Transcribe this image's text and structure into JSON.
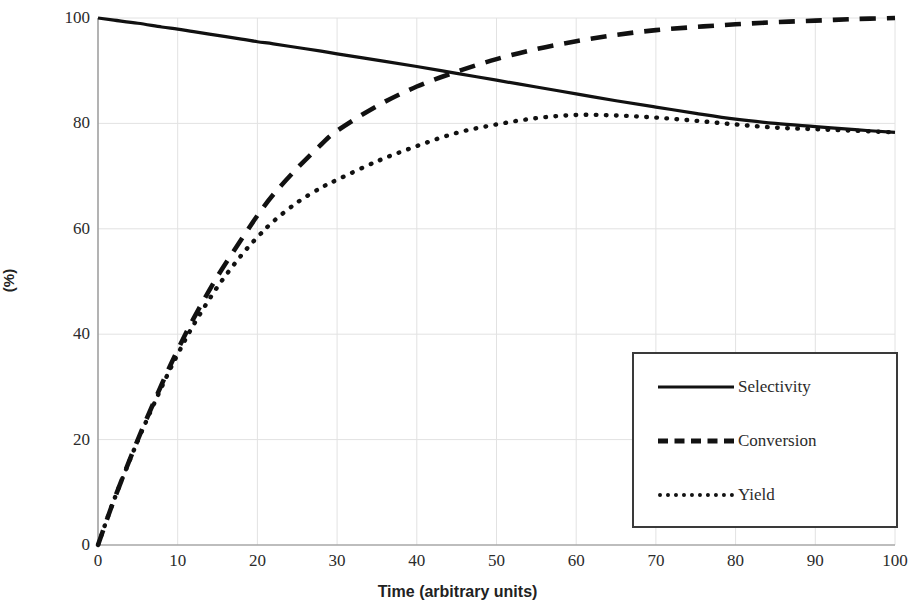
{
  "chart_data": {
    "type": "line",
    "title": "",
    "xlabel": "Time (arbitrary units)",
    "ylabel": "(%)",
    "xlim": [
      0,
      100
    ],
    "ylim": [
      0,
      100
    ],
    "grid": true,
    "legend_position": "inside-bottom-right",
    "xticks": [
      0,
      10,
      20,
      30,
      40,
      50,
      60,
      70,
      80,
      90,
      100
    ],
    "yticks": [
      0,
      20,
      40,
      60,
      80,
      100
    ],
    "x": [
      0,
      2,
      5,
      8,
      10,
      12,
      15,
      18,
      20,
      22,
      25,
      28,
      30,
      35,
      40,
      45,
      50,
      55,
      60,
      65,
      70,
      75,
      80,
      85,
      90,
      95,
      100
    ],
    "series": [
      {
        "name": "Selectivity",
        "style": "solid",
        "values": [
          100,
          99.6,
          99.0,
          98.3,
          97.9,
          97.4,
          96.7,
          96.0,
          95.5,
          95.1,
          94.4,
          93.7,
          93.2,
          92.0,
          90.8,
          89.5,
          88.2,
          86.9,
          85.6,
          84.3,
          83.1,
          81.9,
          80.8,
          80.0,
          79.4,
          78.8,
          78.3
        ]
      },
      {
        "name": "Conversion",
        "style": "dashed",
        "values": [
          0,
          8.5,
          20.0,
          30.5,
          37.0,
          43.0,
          51.0,
          58.0,
          62.5,
          66.5,
          71.5,
          76.0,
          78.6,
          83.3,
          87.0,
          89.8,
          92.2,
          94.1,
          95.6,
          96.8,
          97.7,
          98.3,
          98.8,
          99.2,
          99.5,
          99.8,
          100.0
        ]
      },
      {
        "name": "Yield",
        "style": "dotted",
        "values": [
          0,
          8.5,
          19.8,
          30.0,
          36.2,
          41.8,
          49.0,
          55.0,
          58.4,
          61.4,
          65.0,
          67.8,
          69.3,
          72.8,
          75.7,
          78.2,
          79.8,
          81.0,
          81.6,
          81.5,
          81.1,
          80.5,
          79.8,
          79.2,
          78.9,
          78.6,
          78.3
        ]
      }
    ],
    "annotations": []
  },
  "legend": {
    "items": [
      {
        "label": "Selectivity",
        "sample": "solid-line-icon"
      },
      {
        "label": "Conversion",
        "sample": "dashed-line-icon"
      },
      {
        "label": "Yield",
        "sample": "dotted-line-icon"
      }
    ]
  },
  "axes": {
    "x_title": "Time (arbitrary units)",
    "y_title": "(%)",
    "x_tick_labels": [
      "0",
      "10",
      "20",
      "30",
      "40",
      "50",
      "60",
      "70",
      "80",
      "90",
      "100"
    ],
    "y_tick_labels": [
      "0",
      "20",
      "40",
      "60",
      "80",
      "100"
    ]
  },
  "colors": {
    "line": "#111111",
    "grid": "#e2e2e2",
    "axis": "#8a8a8a",
    "text": "#2b2b2b",
    "background": "#ffffff"
  }
}
